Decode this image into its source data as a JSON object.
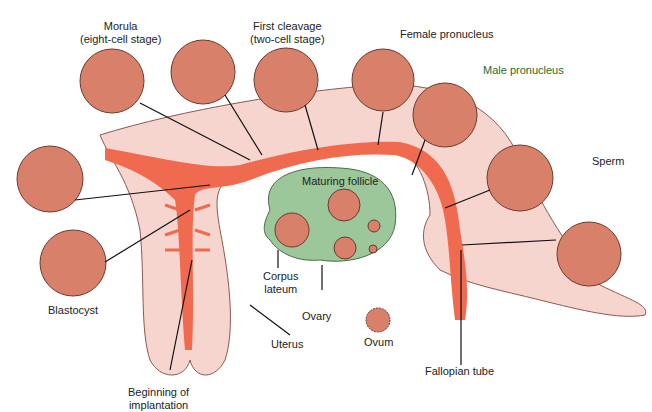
{
  "colors": {
    "uterus_fill": "#f7d5cf",
    "lumen": "#ef6a4f",
    "cell": "#d9806a",
    "cell_stroke": "#6b3a2e",
    "ovary": "#9bc79a",
    "text": "#222222"
  },
  "labels": {
    "morula": "Morula",
    "morula_sub": "(eight-cell stage)",
    "first_cleavage": "First cleavage",
    "first_cleavage_sub": "(two-cell stage)",
    "female_pronucleus": "Female pronucleus",
    "male_pronucleus": "Male pronucleus",
    "sperm": "Sperm",
    "maturing_follicle": "Maturing follicle",
    "corpus": "Corpus",
    "lateum": "lateum",
    "ovary": "Ovary",
    "ovum": "Ovum",
    "blastocyst": "Blastocyst",
    "uterus": "Uterus",
    "beginning_of": "Beginning of",
    "implantation": "implantation",
    "fallopian_tube": "Fallopian tube"
  }
}
